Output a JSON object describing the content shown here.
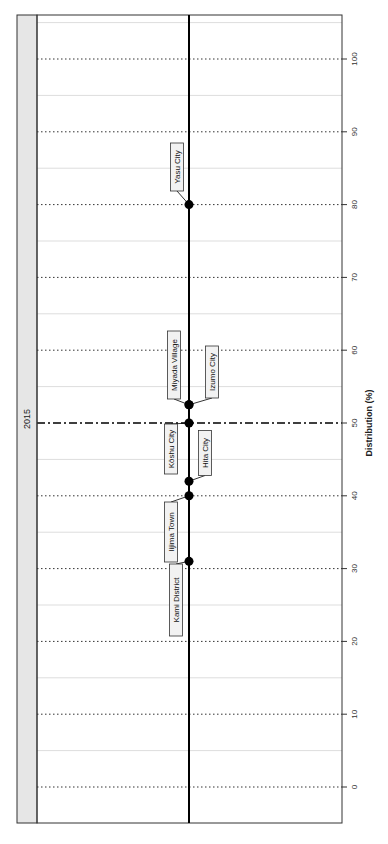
{
  "chart_data": {
    "type": "scatter",
    "title": "",
    "facet_label": "2015",
    "xlabel": "Distribution (%)",
    "ylabel": "",
    "orientation": "rotated-90",
    "xlim": [
      -4,
      105
    ],
    "ticks": [
      0,
      10,
      20,
      30,
      40,
      50,
      60,
      70,
      80,
      90,
      100
    ],
    "tick_labels": [
      "0",
      "10",
      "20",
      "30",
      "40",
      "50",
      "60",
      "70",
      "80",
      "90",
      "100"
    ],
    "reference_line": {
      "value": 50,
      "style": "dash-dot"
    },
    "grid": true,
    "points": [
      {
        "label": "Kami District",
        "value": 31
      },
      {
        "label": "Iijima Town",
        "value": 40
      },
      {
        "label": "Hita City",
        "value": 42
      },
      {
        "label": "Kōshu City",
        "value": 50
      },
      {
        "label": "Izumo City",
        "value": 52.5
      },
      {
        "label": "Miyada Village",
        "value": 52.5
      },
      {
        "label": "Yasu City",
        "value": 80
      }
    ]
  },
  "colors": {
    "strip_bg": "#e6e6e6",
    "frame": "#333333",
    "line": "#000000",
    "minor_grid": "#dddddd"
  }
}
